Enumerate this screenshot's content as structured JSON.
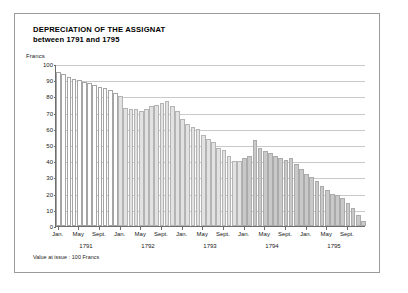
{
  "figure": {
    "title_main": "DEPRECIATION OF THE ASSIGNAT",
    "title_sub": "between 1791 and 1795",
    "footnote": "Value at issue : 100 Francs",
    "frame_color": "#9a9a9a",
    "axis_color": "#6e6e6e",
    "grid_color": "#c9c9c9"
  },
  "chart_data": {
    "type": "bar",
    "title": "DEPRECIATION OF THE ASSIGNAT between 1791 and 1795",
    "xlabel": "",
    "ylabel": "Francs",
    "ylim": [
      0,
      100
    ],
    "yticks": [
      0,
      10,
      20,
      30,
      40,
      50,
      60,
      70,
      80,
      90,
      100
    ],
    "grid": true,
    "legend": "none",
    "annotations": [
      "Value at issue : 100 Francs"
    ],
    "series_name": "Value of the assignat (Francs)",
    "categories": [
      "Jan. 1791",
      "Feb. 1791",
      "Mar. 1791",
      "Apr. 1791",
      "May 1791",
      "Jun. 1791",
      "Jul. 1791",
      "Aug. 1791",
      "Sept. 1791",
      "Oct. 1791",
      "Nov. 1791",
      "Dec. 1791",
      "Jan. 1792",
      "Feb. 1792",
      "Mar. 1792",
      "Apr. 1792",
      "May 1792",
      "Jun. 1792",
      "Jul. 1792",
      "Aug. 1792",
      "Sept. 1792",
      "Oct. 1792",
      "Nov. 1792",
      "Dec. 1792",
      "Jan. 1793",
      "Feb. 1793",
      "Mar. 1793",
      "Apr. 1793",
      "May 1793",
      "Jun. 1793",
      "Jul. 1793",
      "Aug. 1793",
      "Sept. 1793",
      "Oct. 1793",
      "Nov. 1793",
      "Dec. 1793",
      "Jan. 1794",
      "Feb. 1794",
      "Mar. 1794",
      "Apr. 1794",
      "May 1794",
      "Jun. 1794",
      "Jul. 1794",
      "Aug. 1794",
      "Sept. 1794",
      "Oct. 1794",
      "Nov. 1794",
      "Dec. 1794",
      "Jan. 1795",
      "Feb. 1795",
      "Mar. 1795",
      "Apr. 1795",
      "May 1795",
      "Jun. 1795",
      "Jul. 1795",
      "Aug. 1795",
      "Sept. 1795",
      "Oct. 1795",
      "Nov. 1795",
      "Dec. 1795"
    ],
    "values": [
      95,
      94,
      92,
      91,
      90,
      89,
      88,
      87,
      86,
      85,
      84,
      82,
      80,
      73,
      72,
      72,
      71,
      72,
      74,
      75,
      76,
      77,
      74,
      71,
      66,
      63,
      61,
      60,
      56,
      54,
      52,
      48,
      47,
      43,
      40,
      40,
      42,
      43,
      53,
      48,
      46,
      45,
      43,
      42,
      41,
      42,
      38,
      35,
      32,
      30,
      28,
      25,
      22,
      20,
      19,
      17,
      14,
      11,
      7,
      3
    ],
    "groups": [
      {
        "name": "1791",
        "shade": "#ffffff",
        "start_index": 0,
        "end_index": 11
      },
      {
        "name": "1792-1793",
        "shade": "#e2e2e2",
        "start_index": 12,
        "end_index": 35
      },
      {
        "name": "1794-1795",
        "shade": "#c9c9c9",
        "start_index": 36,
        "end_index": 59
      }
    ],
    "x_tick_labels": [
      {
        "label": "Jan.",
        "index": 0
      },
      {
        "label": "May",
        "index": 4
      },
      {
        "label": "Sept.",
        "index": 8
      },
      {
        "label": "Jan.",
        "index": 12
      },
      {
        "label": "May",
        "index": 16
      },
      {
        "label": "Sept.",
        "index": 20
      },
      {
        "label": "Jan.",
        "index": 24
      },
      {
        "label": "May",
        "index": 28
      },
      {
        "label": "Sept.",
        "index": 32
      },
      {
        "label": "Jan.",
        "index": 36
      },
      {
        "label": "May",
        "index": 40
      },
      {
        "label": "Sept.",
        "index": 44
      },
      {
        "label": "Jan.",
        "index": 48
      },
      {
        "label": "May",
        "index": 52
      },
      {
        "label": "Sept.",
        "index": 56
      }
    ],
    "year_labels": [
      {
        "label": "1791",
        "center_index": 5.5
      },
      {
        "label": "1792",
        "center_index": 17.5
      },
      {
        "label": "1793",
        "center_index": 29.5
      },
      {
        "label": "1794",
        "center_index": 41.5
      },
      {
        "label": "1795",
        "center_index": 53.5
      }
    ]
  }
}
